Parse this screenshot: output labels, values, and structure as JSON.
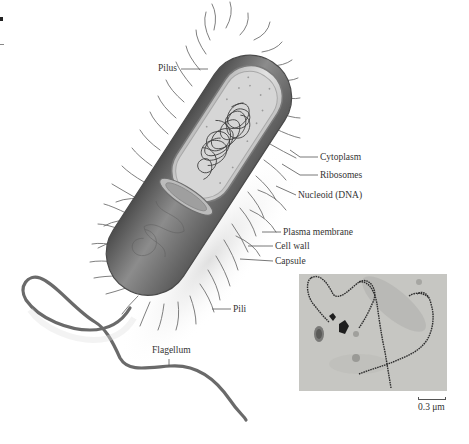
{
  "figure": {
    "labels": {
      "pilus": "Pilus",
      "cytoplasm": "Cytoplasm",
      "ribosomes": "Ribosomes",
      "nucleoid": "Nucleoid (DNA)",
      "plasma_membrane": "Plasma membrane",
      "cell_wall": "Cell wall",
      "capsule": "Capsule",
      "pili": "Pili",
      "flagellum": "Flagellum"
    },
    "micrograph": {
      "scale_label": "0.3 μm"
    }
  },
  "colors": {
    "background": "#ffffff",
    "cell_dark": "#5a5a5a",
    "cell_mid": "#8a8a8a",
    "cell_light": "#cfcfcf",
    "pili": "#6e6e6e",
    "dna": "#3a3a3a",
    "micrograph_bg": "#c4c4c0",
    "label_text": "#333333",
    "leader_line": "#555555"
  }
}
